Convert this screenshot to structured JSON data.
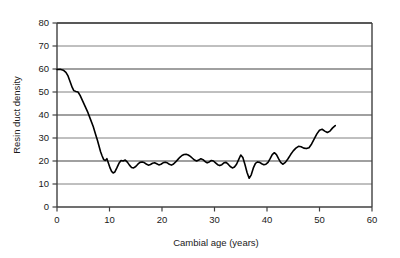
{
  "chart_data": {
    "type": "line",
    "title": "",
    "xlabel": "Cambial age (years)",
    "ylabel": "Resin duct density",
    "xlim": [
      0,
      60
    ],
    "ylim": [
      0,
      80
    ],
    "xticks": [
      0,
      10,
      20,
      30,
      40,
      50,
      60
    ],
    "yticks": [
      0,
      10,
      20,
      30,
      40,
      50,
      60,
      70,
      80
    ],
    "grid": "horizontal",
    "legend": "none",
    "line_color": "#000000",
    "grid_color": "#808080",
    "frame_color": "#404040",
    "background": "#ffffff",
    "series": [
      {
        "name": "Resin duct density",
        "x": [
          0.0,
          0.6,
          1.2,
          1.7,
          2.1,
          2.5,
          2.9,
          3.2,
          3.6,
          4.0,
          4.4,
          4.9,
          5.4,
          5.9,
          6.4,
          6.9,
          7.3,
          7.7,
          8.0,
          8.3,
          8.6,
          8.9,
          9.2,
          9.5,
          9.8,
          10.1,
          10.4,
          10.7,
          11.0,
          11.4,
          11.8,
          12.2,
          12.6,
          13.0,
          13.4,
          13.8,
          14.2,
          14.6,
          15.0,
          15.4,
          15.8,
          16.2,
          16.6,
          17.0,
          17.4,
          17.8,
          18.2,
          18.6,
          19.0,
          19.4,
          19.8,
          20.2,
          20.6,
          21.0,
          21.4,
          21.8,
          22.2,
          22.6,
          23.0,
          23.4,
          23.8,
          24.2,
          24.6,
          25.0,
          25.4,
          25.8,
          26.2,
          26.6,
          27.0,
          27.4,
          27.8,
          28.2,
          28.6,
          29.0,
          29.4,
          29.8,
          30.2,
          30.6,
          31.0,
          31.4,
          31.8,
          32.2,
          32.6,
          33.0,
          33.4,
          33.8,
          34.2,
          34.6,
          35.0,
          35.4,
          35.8,
          36.2,
          36.6,
          37.0,
          37.4,
          37.8,
          38.2,
          38.6,
          39.0,
          39.4,
          39.8,
          40.2,
          40.6,
          41.0,
          41.4,
          41.8,
          42.2,
          42.6,
          43.0,
          43.5,
          44.0,
          44.5,
          45.0,
          45.5,
          46.0,
          46.5,
          47.0,
          47.5,
          48.0,
          48.5,
          49.0,
          49.5,
          50.0,
          50.5,
          51.0,
          51.5,
          52.0,
          52.5,
          53.0
        ],
        "y": [
          59.8,
          59.9,
          59.5,
          58.5,
          57.0,
          54.5,
          52.0,
          50.6,
          50.2,
          50.0,
          48.5,
          46.0,
          43.5,
          41.0,
          38.0,
          35.0,
          32.0,
          29.0,
          26.5,
          24.0,
          22.2,
          20.6,
          20.2,
          21.0,
          19.0,
          17.0,
          15.5,
          14.8,
          15.2,
          17.0,
          19.0,
          20.2,
          20.0,
          20.4,
          19.5,
          18.2,
          17.2,
          17.0,
          17.6,
          18.6,
          19.4,
          19.6,
          19.3,
          18.7,
          18.2,
          18.5,
          19.0,
          19.2,
          18.8,
          18.3,
          18.6,
          19.2,
          19.5,
          19.2,
          18.6,
          18.2,
          18.7,
          19.6,
          20.6,
          21.6,
          22.4,
          22.8,
          22.9,
          22.6,
          22.0,
          21.2,
          20.4,
          20.0,
          20.4,
          21.0,
          20.6,
          19.8,
          19.2,
          19.6,
          20.2,
          20.0,
          19.2,
          18.4,
          18.0,
          18.4,
          19.2,
          19.4,
          18.6,
          17.6,
          17.0,
          17.4,
          18.6,
          20.6,
          22.6,
          21.5,
          18.5,
          15.0,
          12.5,
          14.0,
          17.0,
          19.0,
          19.6,
          19.4,
          18.8,
          18.4,
          18.6,
          19.4,
          21.0,
          22.8,
          23.6,
          22.8,
          21.0,
          19.4,
          18.6,
          19.4,
          21.0,
          22.8,
          24.4,
          25.6,
          26.4,
          26.2,
          25.6,
          25.4,
          25.8,
          27.4,
          29.6,
          31.8,
          33.4,
          33.8,
          33.0,
          32.4,
          33.0,
          34.4,
          35.4
        ]
      }
    ]
  },
  "axes": {
    "x_tick_labels": [
      "0",
      "10",
      "20",
      "30",
      "40",
      "50",
      "60"
    ],
    "y_tick_labels": [
      "0",
      "10",
      "20",
      "30",
      "40",
      "50",
      "60",
      "70",
      "80"
    ],
    "x_axis_title": "Cambial age (years)",
    "y_axis_title": "Resin duct density"
  }
}
